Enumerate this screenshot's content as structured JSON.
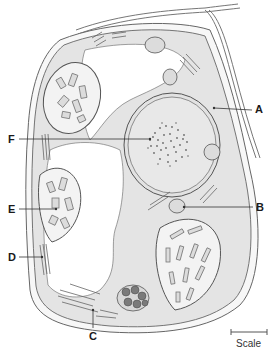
{
  "diagram": {
    "type": "cell-cross-section",
    "labels": [
      {
        "id": "A",
        "text": "A",
        "target": "cell wall / plasma membrane"
      },
      {
        "id": "B",
        "text": "B",
        "target": "small organelle (mitochondrion)"
      },
      {
        "id": "C",
        "text": "C",
        "target": "endoplasmic reticulum / membranes at cell base"
      },
      {
        "id": "D",
        "text": "D",
        "target": "stacked membranes near wall"
      },
      {
        "id": "E",
        "text": "E",
        "target": "chloroplast"
      },
      {
        "id": "F",
        "text": "F",
        "target": "nucleus"
      }
    ],
    "scale_bar": {
      "label": "Scale"
    }
  },
  "colors": {
    "cytoplasm": "#e6e6e6",
    "outline": "#555555",
    "chloroplast_fill": "#f5f5f5",
    "dark_granules": "#777777",
    "label": "#1a1a1a"
  }
}
